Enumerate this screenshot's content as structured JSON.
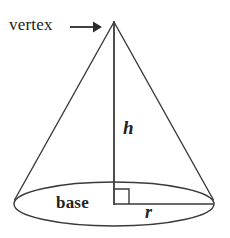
{
  "figure": {
    "background_color": "#ffffff",
    "stroke_color": "#3a3a3a",
    "text_color": "#222222",
    "labels": {
      "vertex": "vertex",
      "base": "base",
      "height": "h",
      "radius": "r"
    },
    "annotations": {
      "vertex_arrow": "arrow-right",
      "right_angle": "right-angle-marker"
    },
    "geometry": {
      "apex_x": 114,
      "apex_y": 22,
      "base_center_x": 114,
      "base_center_y": 204,
      "base_radius_x": 100,
      "base_radius_y": 22,
      "height_px": 182,
      "right_angle_size": 15,
      "arrow_start_x": 70,
      "arrow_end_x": 101,
      "arrow_y": 27
    }
  }
}
